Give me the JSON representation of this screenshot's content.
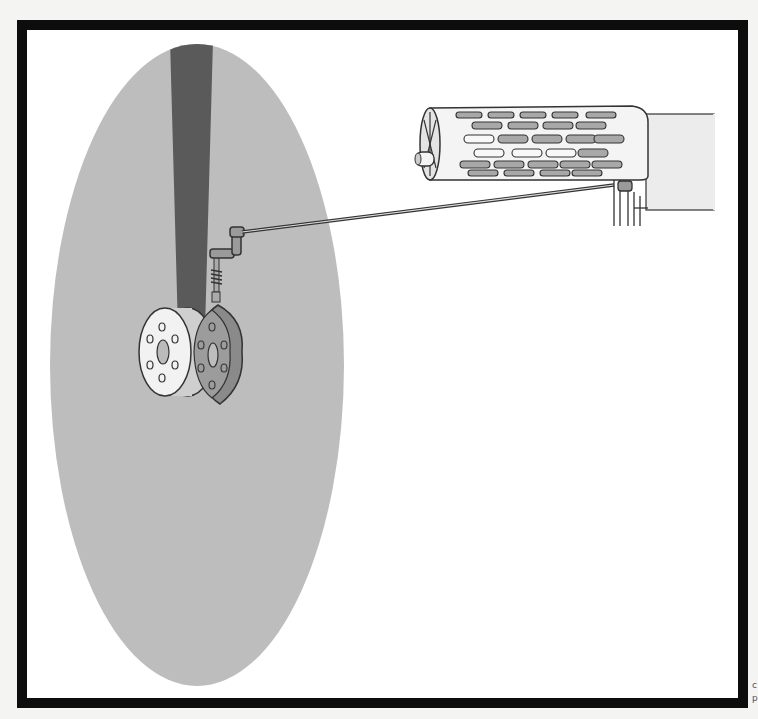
{
  "figure": {
    "type": "technical-illustration",
    "colors": {
      "frame": "#0d0d0d",
      "background": "#ffffff",
      "ellipse_fill": "#bdbdbd",
      "shaft_fill": "#5a5a5a",
      "part_light": "#eeeeee",
      "part_mid": "#9a9a9a",
      "line": "#333333"
    },
    "components": [
      {
        "id": "highlight-ellipse",
        "label": "gray elliptical highlight area"
      },
      {
        "id": "vertical-shaft",
        "label": "dark vertical shaft/arm"
      },
      {
        "id": "flanged-wheel",
        "label": "white flanged wheel with bolt holes"
      },
      {
        "id": "cam-disc",
        "label": "gray cam disc"
      },
      {
        "id": "spring-follower",
        "label": "spring-loaded follower rod"
      },
      {
        "id": "crank-linkage",
        "label": "crank linkage"
      },
      {
        "id": "connecting-rod",
        "label": "long connecting rod"
      },
      {
        "id": "perforated-cylinder",
        "label": "perforated drum/cylinder with slots"
      },
      {
        "id": "housing-block",
        "label": "rectangular housing block"
      },
      {
        "id": "bracket-lever",
        "label": "bracket lever at cylinder base"
      }
    ]
  },
  "margin_marks": [
    "c",
    "p"
  ]
}
